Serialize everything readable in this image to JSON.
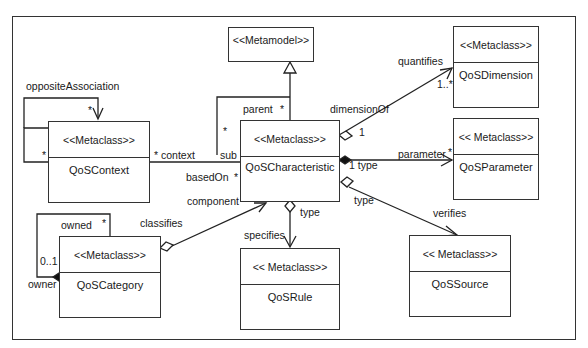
{
  "diagram": {
    "metamodel": {
      "stereotype": "<<Metamodel>>"
    },
    "classes": [
      {
        "id": "context",
        "stereotype": "<<Metaclass>>",
        "name": "QoSContext"
      },
      {
        "id": "characteristic",
        "stereotype": "<<Metaclass>>",
        "name": "QoSCharacteristic"
      },
      {
        "id": "dimension",
        "stereotype": "<<Metaclass>>",
        "name": "QoSDimension"
      },
      {
        "id": "parameter",
        "stereotype": "<< Metaclass>>",
        "name": "QoSParameter"
      },
      {
        "id": "category",
        "stereotype": "<<Metaclass>>",
        "name": "QoSCategory"
      },
      {
        "id": "rule",
        "stereotype": "<< Metaclass>>",
        "name": "QoSRule"
      },
      {
        "id": "source",
        "stereotype": "<< Metaclass>>",
        "name": "QoSSource"
      }
    ],
    "labels": {
      "opposite_association": "oppositeAssociation",
      "opp_star_top": "*",
      "opp_star_left": "*",
      "context": "* context",
      "sub": "sub",
      "sub_star": "*",
      "parent": "parent",
      "parent_star": "*",
      "based_on": "basedOn",
      "based_on_star": "*",
      "component": "component",
      "quantifies": "quantifies",
      "dim_mult": "1..*",
      "dimension_of": "dimensionOf",
      "dim_one": "1",
      "parameter": "parameter",
      "param_star": "*",
      "type_one": "1 type",
      "type_right": "type",
      "verifies": "verifies",
      "type_down": "type",
      "specifies": "specifies",
      "classifies": "classifies",
      "owned": "owned",
      "owned_star": "*",
      "owner_mult": "0..1",
      "owner": "owner"
    }
  }
}
